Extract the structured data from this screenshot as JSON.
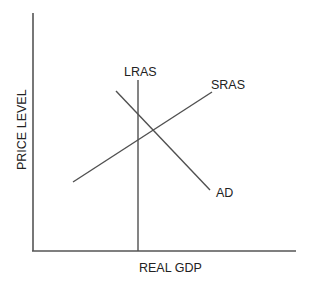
{
  "diagram": {
    "type": "aggregate-demand-aggregate-supply",
    "x_axis_label": "REAL GDP",
    "y_axis_label": "PRICE LEVEL",
    "curves": {
      "lras": {
        "label": "LRAS",
        "kind": "vertical line"
      },
      "sras": {
        "label": "SRAS",
        "kind": "upward-sloping line"
      },
      "ad": {
        "label": "AD",
        "kind": "downward-sloping line"
      }
    },
    "colors": {
      "background": "#ffffff",
      "lines": "#505050",
      "text": "#222222"
    }
  }
}
